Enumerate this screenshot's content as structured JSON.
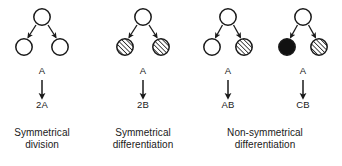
{
  "figure": {
    "background_color": "#ffffff",
    "stroke_color": "#1a1a1a",
    "fill_black": "#111111",
    "fill_open": "#ffffff",
    "hatch_color": "#1a1a1a",
    "panels": [
      {
        "id": "panel-symmetrical-division",
        "mother_cell": {
          "fill": "open"
        },
        "daughter_cells": [
          {
            "fill": "open"
          },
          {
            "fill": "open"
          }
        ],
        "input_label": "A",
        "output_label": "2A",
        "caption_lines": [
          "Symmetrical",
          "division"
        ]
      },
      {
        "id": "panel-symmetrical-differentiation",
        "mother_cell": {
          "fill": "open"
        },
        "daughter_cells": [
          {
            "fill": "hatched"
          },
          {
            "fill": "hatched"
          }
        ],
        "input_label": "A",
        "output_label": "2B",
        "caption_lines": [
          "Symmetrical",
          "differentiation"
        ]
      },
      {
        "id": "panel-non-symmetrical-ab",
        "mother_cell": {
          "fill": "open"
        },
        "daughter_cells": [
          {
            "fill": "open"
          },
          {
            "fill": "hatched"
          }
        ],
        "input_label": "A",
        "output_label": "AB",
        "caption_lines": []
      },
      {
        "id": "panel-non-symmetrical-cb",
        "mother_cell": {
          "fill": "open"
        },
        "daughter_cells": [
          {
            "fill": "black"
          },
          {
            "fill": "hatched"
          }
        ],
        "input_label": "A",
        "output_label": "CB",
        "caption_lines": []
      }
    ],
    "shared_caption": {
      "id": "caption-non-symmetrical-differentiation",
      "lines": [
        "Non-symmetrical",
        "differentiation"
      ],
      "spans_panels": [
        "panel-non-symmetrical-ab",
        "panel-non-symmetrical-cb"
      ]
    }
  }
}
